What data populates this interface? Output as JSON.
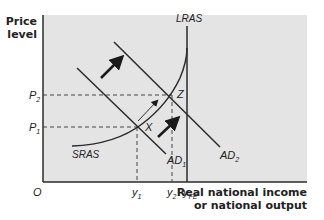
{
  "diagram": {
    "type": "economics-ad-as",
    "y_axis_title": [
      "Price",
      "level"
    ],
    "x_axis_title": [
      "Real national income",
      "or national output"
    ],
    "origin_label": "O",
    "curves": {
      "lras": {
        "label": "LRAS"
      },
      "sras": {
        "label": "SRAS"
      },
      "ad1": {
        "label": "AD",
        "sub": "1"
      },
      "ad2": {
        "label": "AD",
        "sub": "2"
      }
    },
    "points": {
      "x": {
        "label": "X"
      },
      "z": {
        "label": "Z"
      }
    },
    "price_ticks": [
      {
        "label": "P",
        "sub": "2"
      },
      {
        "label": "P",
        "sub": "1"
      }
    ],
    "output_ticks": [
      {
        "label": "y",
        "sub": "1"
      },
      {
        "label": "y",
        "sub": "2"
      },
      {
        "label": "y",
        "sub": "FE"
      }
    ],
    "arrows": [
      {
        "name": "ad-shift-arrow-upper",
        "style": "bold"
      },
      {
        "name": "ad-shift-arrow-lower",
        "style": "bold"
      },
      {
        "name": "movement-x-to-z-arrow",
        "style": "thin"
      }
    ],
    "colors": {
      "plot_background": "#e4e4e4",
      "line": "#2b2b2b",
      "text": "#222222"
    }
  }
}
